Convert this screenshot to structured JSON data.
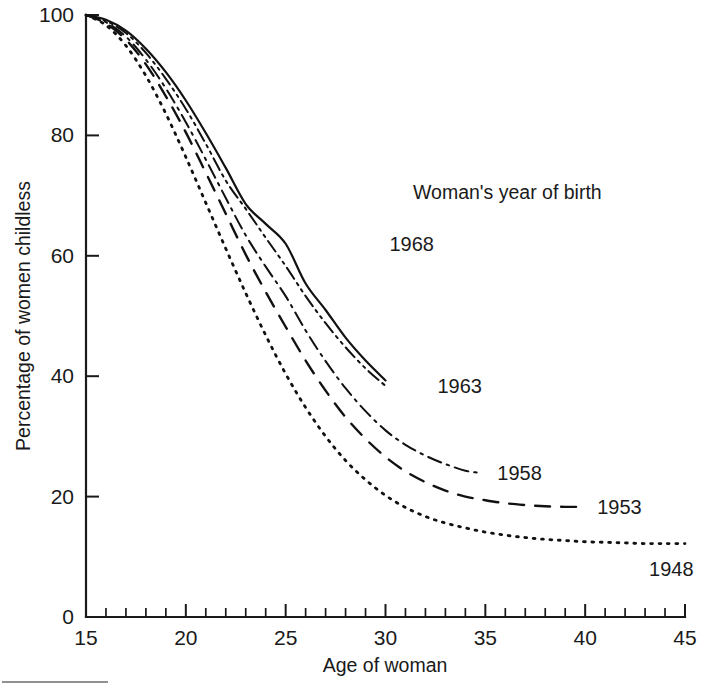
{
  "chart_data": {
    "type": "line",
    "title": "",
    "xlabel": "Age of woman",
    "ylabel": "Percentage of women childless",
    "legend_title": "Woman's year of birth",
    "legend_position": "inline-right-of-curve-ends",
    "grid": false,
    "xlim": [
      15,
      45
    ],
    "ylim": [
      0,
      100
    ],
    "xticks": [
      15,
      16,
      17,
      18,
      19,
      20,
      21,
      22,
      23,
      24,
      25,
      26,
      27,
      28,
      29,
      30,
      31,
      32,
      33,
      34,
      35,
      36,
      37,
      38,
      39,
      40,
      41,
      42,
      43,
      44,
      45
    ],
    "xtick_labels": [
      "15",
      "20",
      "25",
      "30",
      "35",
      "40",
      "45"
    ],
    "xtick_labelled_values": [
      15,
      20,
      25,
      30,
      35,
      40,
      45
    ],
    "yticks": [
      0,
      20,
      40,
      60,
      80,
      100
    ],
    "ytick_labels": [
      "0",
      "20",
      "40",
      "60",
      "80",
      "100"
    ],
    "series": [
      {
        "name": "1968",
        "label": "1968",
        "linestyle": "solid",
        "dasharray": "",
        "stroke_width": 2.2,
        "color": "#111111",
        "label_x": 30.2,
        "label_y": 62.0,
        "x": [
          15,
          16,
          17,
          18,
          19,
          20,
          21,
          22,
          23,
          24,
          25,
          26,
          27,
          28,
          29,
          30
        ],
        "y": [
          100,
          99.2,
          97.4,
          94.4,
          90.5,
          85.8,
          80.4,
          74.6,
          68.6,
          65.3,
          62.0,
          55.4,
          51.0,
          46.4,
          42.6,
          39.3
        ]
      },
      {
        "name": "1963",
        "label": "1963",
        "linestyle": "dash-dot-dot",
        "dasharray": "13,5,2.5,5,2.5,5",
        "stroke_width": 2.0,
        "color": "#111111",
        "label_x": 32.6,
        "label_y": 38.4,
        "x": [
          15,
          16,
          17,
          18,
          19,
          20,
          21,
          22,
          23,
          24,
          25,
          26,
          27,
          28,
          29,
          30
        ],
        "y": [
          100,
          99.0,
          97.0,
          93.7,
          89.4,
          84.4,
          78.6,
          72.5,
          67.8,
          63.0,
          58.3,
          53.3,
          48.8,
          44.8,
          41.3,
          38.4
        ]
      },
      {
        "name": "1958",
        "label": "1958",
        "linestyle": "dash-dot",
        "dasharray": "14,6,2.5,6",
        "stroke_width": 2.0,
        "color": "#111111",
        "label_x": 35.6,
        "label_y": 24.0,
        "x": [
          15,
          16,
          17,
          18,
          19,
          20,
          21,
          22,
          23,
          24,
          25,
          26,
          27,
          28,
          29,
          30,
          31,
          32,
          33,
          34,
          34.6
        ],
        "y": [
          100,
          98.8,
          96.4,
          92.6,
          87.8,
          82.2,
          76.0,
          69.6,
          63.4,
          58.2,
          53.3,
          47.6,
          42.5,
          38.0,
          34.2,
          31.0,
          28.6,
          26.8,
          25.4,
          24.3,
          24.0
        ]
      },
      {
        "name": "1953",
        "label": "1953",
        "linestyle": "dashed",
        "dasharray": "15,11",
        "stroke_width": 2.4,
        "color": "#111111",
        "label_x": 40.6,
        "label_y": 18.3,
        "x": [
          15,
          16,
          17,
          18,
          19,
          20,
          21,
          22,
          23,
          24,
          25,
          26,
          27,
          28,
          29,
          30,
          31,
          32,
          33,
          34,
          35,
          36,
          37,
          38,
          39,
          40
        ],
        "y": [
          100,
          98.6,
          95.9,
          91.8,
          86.5,
          80.5,
          73.8,
          67.0,
          60.2,
          54.0,
          48.2,
          42.6,
          37.6,
          33.2,
          29.6,
          26.6,
          24.2,
          22.4,
          21.0,
          20.0,
          19.4,
          18.9,
          18.6,
          18.4,
          18.3,
          18.3
        ]
      },
      {
        "name": "1948",
        "label": "1948",
        "linestyle": "dotted",
        "dasharray": "1.8,6.6",
        "stroke_width": 2.8,
        "color": "#111111",
        "label_x": 43.2,
        "label_y": 8.0,
        "x": [
          15,
          16,
          17,
          18,
          19,
          20,
          21,
          22,
          23,
          24,
          25,
          26,
          27,
          28,
          29,
          30,
          31,
          32,
          33,
          34,
          35,
          36,
          37,
          38,
          39,
          40,
          41,
          42,
          43,
          44,
          45
        ],
        "y": [
          100,
          98.3,
          94.9,
          89.9,
          83.6,
          76.4,
          68.8,
          61.2,
          53.8,
          46.8,
          40.4,
          34.8,
          30.0,
          26.0,
          22.8,
          20.2,
          18.2,
          16.7,
          15.6,
          14.8,
          14.1,
          13.6,
          13.2,
          12.9,
          12.7,
          12.5,
          12.4,
          12.3,
          12.2,
          12.2,
          12.2
        ]
      }
    ]
  },
  "figure": {
    "legend_title": "Woman's year of birth",
    "x_axis_title": "Age of woman",
    "y_axis_title": "Percentage of women childless"
  }
}
